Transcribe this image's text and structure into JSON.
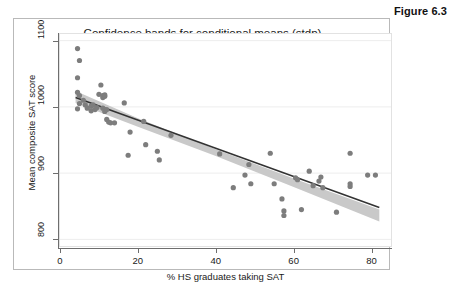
{
  "figure": {
    "caption": "Figure 6.3",
    "title": "Confidence bands for conditional means (stdp)"
  },
  "chart_data": {
    "type": "scatter",
    "title": "Confidence bands for conditional means (stdp)",
    "xlabel": "% HS graduates taking SAT",
    "ylabel": "Mean composite SAT score",
    "xlim": [
      0,
      85
    ],
    "ylim": [
      790,
      1110
    ],
    "xticks": [
      0,
      20,
      40,
      60,
      80
    ],
    "yticks": [
      800,
      900,
      1000,
      1100
    ],
    "xtick_labels": [
      "0",
      "20",
      "40",
      "60",
      "80"
    ],
    "ytick_labels": [
      "800",
      "900",
      "1000",
      "1100"
    ],
    "grid": "horizontal-only",
    "legend": "none",
    "marker_color": "#7d7d7d",
    "line_color": "#333333",
    "band_color": "#c9c9c9",
    "series": [
      {
        "name": "states",
        "type": "scatter",
        "points": [
          [
            4.5,
            1088
          ],
          [
            5.0,
            1070
          ],
          [
            4.5,
            1044
          ],
          [
            4.5,
            1022
          ],
          [
            5.0,
            1017
          ],
          [
            4.5,
            997
          ],
          [
            5.0,
            1005
          ],
          [
            6.0,
            1010
          ],
          [
            6.5,
            1003
          ],
          [
            7.0,
            998
          ],
          [
            8.0,
            1001
          ],
          [
            8.0,
            994
          ],
          [
            8.5,
            1003
          ],
          [
            9.0,
            996
          ],
          [
            9.5,
            999
          ],
          [
            10.0,
            1019
          ],
          [
            10.5,
            1033
          ],
          [
            11.0,
            1017
          ],
          [
            11.0,
            1014
          ],
          [
            11.5,
            1018
          ],
          [
            11.5,
            1016
          ],
          [
            11.0,
            998
          ],
          [
            11.5,
            993
          ],
          [
            12.0,
            996
          ],
          [
            12.0,
            981
          ],
          [
            12.5,
            977
          ],
          [
            13.0,
            976
          ],
          [
            14.0,
            976
          ],
          [
            16.5,
            1006
          ],
          [
            17.5,
            927
          ],
          [
            18.0,
            962
          ],
          [
            21.5,
            978
          ],
          [
            22.0,
            943
          ],
          [
            25.0,
            933
          ],
          [
            25.5,
            920
          ],
          [
            28.5,
            957
          ],
          [
            41.0,
            929
          ],
          [
            44.5,
            878
          ],
          [
            47.5,
            897
          ],
          [
            48.5,
            913
          ],
          [
            49.0,
            884
          ],
          [
            54.0,
            930
          ],
          [
            55.0,
            884
          ],
          [
            57.0,
            861
          ],
          [
            57.5,
            843
          ],
          [
            57.5,
            836
          ],
          [
            60.5,
            893
          ],
          [
            61.0,
            890
          ],
          [
            62.0,
            845
          ],
          [
            64.0,
            903
          ],
          [
            65.0,
            881
          ],
          [
            66.5,
            888
          ],
          [
            67.0,
            894
          ],
          [
            67.5,
            878
          ],
          [
            71.0,
            841
          ],
          [
            74.5,
            930
          ],
          [
            74.5,
            884
          ],
          [
            74.5,
            880
          ],
          [
            79.0,
            897
          ],
          [
            81.0,
            897
          ]
        ]
      },
      {
        "name": "fitted line",
        "type": "line",
        "x": [
          4.0,
          82.0
        ],
        "y": [
          1014,
          848
        ]
      },
      {
        "name": "95% confidence band",
        "type": "band",
        "x": [
          4.0,
          20.0,
          40.0,
          60.0,
          82.0
        ],
        "lower": [
          1006,
          970,
          926,
          879,
          827
        ],
        "upper": [
          1024,
          983,
          936,
          892,
          845
        ]
      }
    ]
  }
}
